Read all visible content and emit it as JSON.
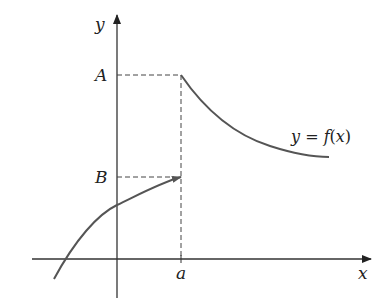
{
  "diagram": {
    "axes": {
      "x_label": "x",
      "y_label": "y",
      "origin": {
        "x": 117,
        "y": 259
      },
      "x_axis": {
        "start": 32,
        "end": 371
      },
      "y_axis": {
        "top": 15,
        "bottom": 298
      }
    },
    "labels": {
      "A": "A",
      "B": "B",
      "a": "a",
      "curve_eq_y": "y",
      "curve_eq_equals": " = ",
      "curve_eq_f": "f",
      "curve_eq_open": "(",
      "curve_eq_x": "x",
      "curve_eq_close": ")"
    },
    "points": {
      "A": {
        "x": 181,
        "y": 75
      },
      "B": {
        "x": 181,
        "y": 177
      },
      "a_on_x_axis": {
        "x": 181,
        "y": 259
      }
    },
    "curves": [
      {
        "name": "left-branch",
        "description": "increasing concave-down branch approaching B from the left (open endpoint with arrow)",
        "path": "M54,279 C75,240 98,214 117,205 C140,194 160,183 181,177"
      },
      {
        "name": "right-branch",
        "description": "decreasing branch starting at A and leveling off toward the right",
        "path": "M181,75 C205,110 235,135 270,146 C295,154 312,157 329,157"
      }
    ],
    "colors": {
      "axis": "#333333",
      "curve": "#555555",
      "dashed": "#444444",
      "text": "#222222"
    }
  }
}
